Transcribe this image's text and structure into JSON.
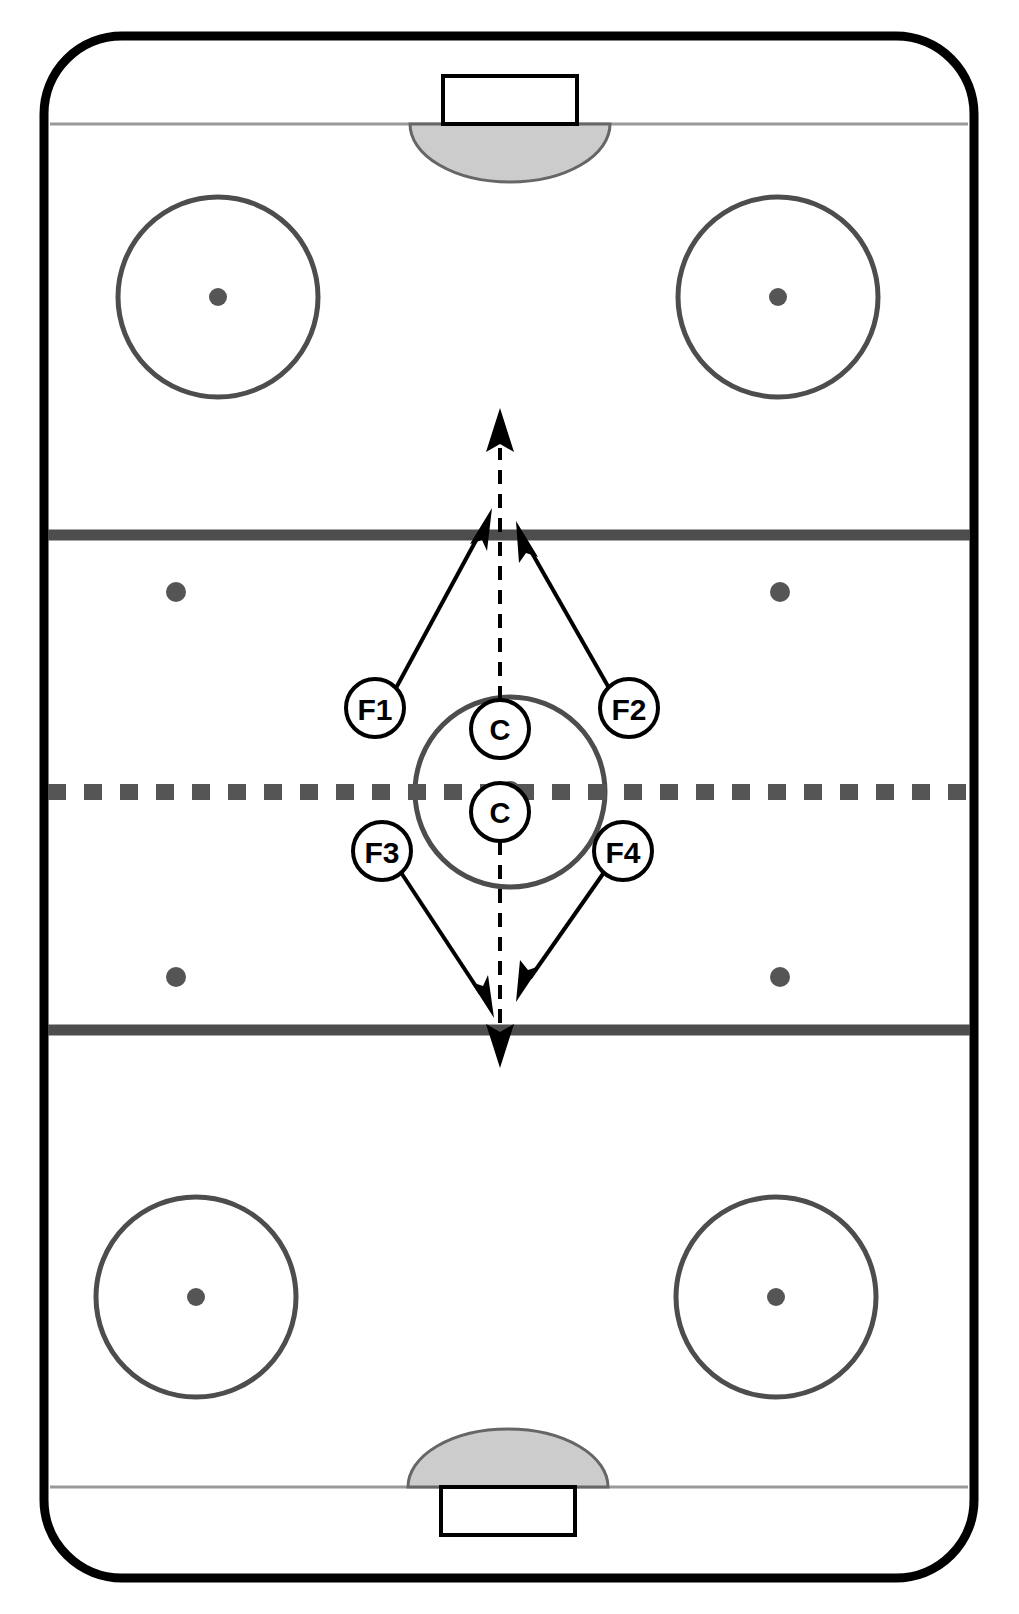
{
  "diagram": {
    "type": "ice-hockey-rink-play-diagram",
    "canvas": {
      "width": 1019,
      "height": 1614
    },
    "background_color": "#ffffff"
  },
  "colors": {
    "boards": "#000000",
    "ice": "#ffffff",
    "blue_line": "#4d4d4d",
    "center_line": "#555555",
    "goal_line": "#999999",
    "faceoff_circle": "#4d4d4d",
    "faceoff_dot": "#555555",
    "crease_fill": "#cccccc",
    "crease_stroke": "#666666",
    "net_stroke": "#000000",
    "net_fill": "#ffffff",
    "arrow_solid": "#000000",
    "arrow_dashed": "#000000",
    "marker_stroke": "#000000",
    "marker_fill": "#ffffff",
    "marker_text": "#000000"
  },
  "rink": {
    "boards": {
      "name": "rink-boards",
      "x": 44,
      "y": 36,
      "width": 930,
      "height": 1542,
      "corner_radius": 78,
      "stroke_width": 9
    },
    "goal_lines": [
      {
        "name": "top-goal-line",
        "y": 124,
        "x1": 50,
        "x2": 968,
        "stroke_width": 3
      },
      {
        "name": "bottom-goal-line",
        "y": 1487,
        "x1": 50,
        "x2": 968,
        "stroke_width": 3
      }
    ],
    "blue_lines": [
      {
        "name": "top-blue-line",
        "y": 535,
        "x1": 48,
        "x2": 970,
        "stroke_width": 11
      },
      {
        "name": "bottom-blue-line",
        "y": 1030,
        "x1": 48,
        "x2": 970,
        "stroke_width": 11
      }
    ],
    "center_line": {
      "name": "center-red-line",
      "y": 792,
      "x1": 48,
      "x2": 970,
      "stroke_width": 16,
      "dash": "18 18",
      "style": "dashed-square"
    },
    "center_ice_circle": {
      "name": "center-ice-faceoff-circle",
      "cx": 510,
      "cy": 792,
      "r": 95,
      "stroke_width": 5
    },
    "center_ice_dot": {
      "name": "center-ice-dot",
      "cx": 510,
      "cy": 792,
      "r": 11
    },
    "end_zone_circles": [
      {
        "name": "faceoff-circle-top-left",
        "cx": 218,
        "cy": 297,
        "r": 100,
        "dot_r": 9
      },
      {
        "name": "faceoff-circle-top-right",
        "cx": 778,
        "cy": 297,
        "r": 100,
        "dot_r": 9
      },
      {
        "name": "faceoff-circle-bottom-left",
        "cx": 196,
        "cy": 1297,
        "r": 100,
        "dot_r": 9
      },
      {
        "name": "faceoff-circle-bottom-right",
        "cx": 776,
        "cy": 1297,
        "r": 100,
        "dot_r": 9
      }
    ],
    "neutral_zone_dots": [
      {
        "name": "neutral-dot-top-left",
        "cx": 176,
        "cy": 592,
        "r": 10
      },
      {
        "name": "neutral-dot-top-right",
        "cx": 780,
        "cy": 592,
        "r": 10
      },
      {
        "name": "neutral-dot-bottom-left",
        "cx": 176,
        "cy": 977,
        "r": 10
      },
      {
        "name": "neutral-dot-bottom-right",
        "cx": 780,
        "cy": 977,
        "r": 10
      }
    ],
    "goals": [
      {
        "name": "goal-top",
        "crease": {
          "cx": 510,
          "cy": 124,
          "rx": 100,
          "ry": 58,
          "side": "below"
        },
        "net": {
          "x": 443,
          "y": 76,
          "width": 134,
          "height": 48
        }
      },
      {
        "name": "goal-bottom",
        "crease": {
          "cx": 508,
          "cy": 1487,
          "rx": 100,
          "ry": 58,
          "side": "above"
        },
        "net": {
          "x": 441,
          "y": 1487,
          "width": 134,
          "height": 48
        }
      }
    ]
  },
  "players": [
    {
      "id": "F1",
      "name": "player-marker-f1",
      "label": "F1",
      "cx": 375,
      "cy": 708,
      "r": 29
    },
    {
      "id": "F2",
      "name": "player-marker-f2",
      "label": "F2",
      "cx": 629,
      "cy": 708,
      "r": 29
    },
    {
      "id": "F3",
      "name": "player-marker-f3",
      "label": "F3",
      "cx": 382,
      "cy": 851,
      "r": 29
    },
    {
      "id": "F4",
      "name": "player-marker-f4",
      "label": "F4",
      "cx": 623,
      "cy": 851,
      "r": 29
    },
    {
      "id": "C-top",
      "name": "player-marker-c-top",
      "label": "C",
      "cx": 500,
      "cy": 729,
      "r": 29
    },
    {
      "id": "C-bottom",
      "name": "player-marker-c-bottom",
      "label": "C",
      "cx": 500,
      "cy": 812,
      "r": 29
    }
  ],
  "arrows": {
    "solid": [
      {
        "name": "arrow-f1-to-top-blue-line",
        "from": [
          396,
          688
        ],
        "to": [
          492,
          511
        ],
        "style": "solid"
      },
      {
        "name": "arrow-f2-to-top-blue-line",
        "from": [
          609,
          688
        ],
        "to": [
          518,
          525
        ],
        "style": "solid"
      },
      {
        "name": "arrow-f3-to-bottom-blue-line",
        "from": [
          400,
          871
        ],
        "to": [
          492,
          1010
        ],
        "style": "solid"
      },
      {
        "name": "arrow-f4-to-bottom-blue-line",
        "from": [
          605,
          871
        ],
        "to": [
          519,
          998
        ],
        "style": "solid"
      }
    ],
    "dashed": [
      {
        "name": "arrow-c-top-skate-up",
        "from": [
          500,
          700
        ],
        "to": [
          500,
          415
        ],
        "style": "dashed"
      },
      {
        "name": "arrow-c-bottom-skate-down",
        "from": [
          500,
          841
        ],
        "to": [
          500,
          1060
        ],
        "style": "dashed"
      }
    ],
    "dash_pattern": "14 10",
    "stroke_width": 4,
    "head_length": 34,
    "head_width": 26
  }
}
